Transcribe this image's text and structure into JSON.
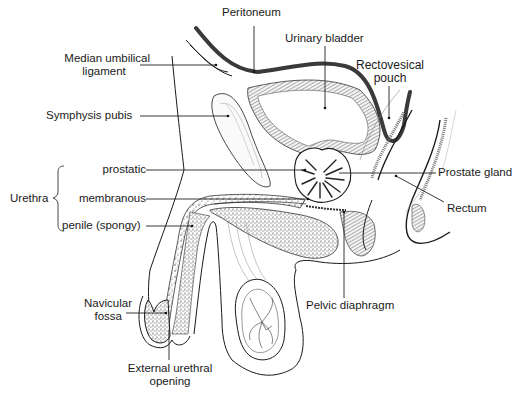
{
  "figure": {
    "colors": {
      "line": "#1a1a1a",
      "peritoneum": "#3a3a3a",
      "leader_line": "#222222",
      "stipple": "#555555",
      "background": "#ffffff"
    }
  },
  "labels": {
    "peritoneum": "Peritoneum",
    "urinary_bladder": "Urinary bladder",
    "median_umbilical_ligament_1": "Median umbilical",
    "median_umbilical_ligament_2": "ligament",
    "rectovesical_pouch_1": "Rectovesical",
    "rectovesical_pouch_2": "pouch",
    "symphysis_pubis": "Symphysis pubis",
    "urethra": "Urethra",
    "prostatic": "prostatic",
    "membranous": "membranous",
    "penile_spongy": "penile (spongy)",
    "prostate_gland": "Prostate gland",
    "rectum": "Rectum",
    "navicular_fossa_1": "Navicular",
    "navicular_fossa_2": "fossa",
    "external_urethral_opening_1": "External urethral",
    "external_urethral_opening_2": "opening",
    "pelvic_diaphragm": "Pelvic diaphragm"
  },
  "groups": {
    "urethra_parts": [
      "prostatic",
      "membranous",
      "penile (spongy)"
    ]
  }
}
